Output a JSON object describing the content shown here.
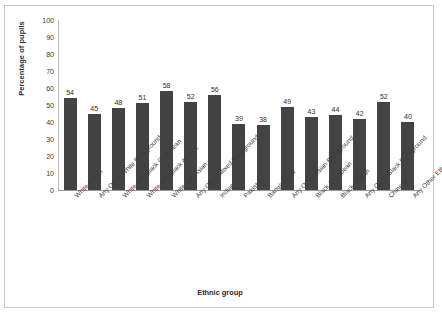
{
  "chart_data": {
    "type": "bar",
    "title": "",
    "xlabel": "Ethnic group",
    "ylabel": "Percentage of pupils",
    "ylim": [
      0,
      100
    ],
    "ytick_step": 10,
    "yticks": [
      100,
      90,
      80,
      70,
      60,
      50,
      40,
      30,
      20,
      10,
      0
    ],
    "grid": false,
    "legend": false,
    "bar_color": "#434343",
    "categories": [
      "White British",
      "Any Other White Background",
      "White and Black Caribbean",
      "White and Black African",
      "White and Asian",
      "Any Other Mixed Background",
      "Indian",
      "Pakistani",
      "Bangladeshi",
      "Any Other Asian Background",
      "Black Caribbean",
      "Black African",
      "Any Other Black Background",
      "Chinese",
      "Any Other Ethnic Group"
    ],
    "values": [
      54,
      45,
      48,
      51,
      58,
      52,
      56,
      39,
      38,
      49,
      43,
      44,
      42,
      52,
      40
    ]
  }
}
